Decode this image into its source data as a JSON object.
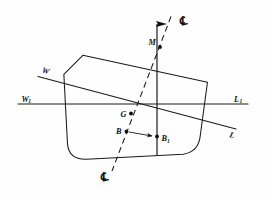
{
  "figure": {
    "background_color": "#fefefe",
    "ink_color": "#101010"
  },
  "labels": {
    "upright_waterline_port": "W",
    "upright_waterline_port_sub": "1",
    "upright_waterline_starboard": "L",
    "upright_waterline_starboard_sub": "1",
    "heeled_waterline_port": "W",
    "heeled_waterline_starboard": "L",
    "metacenter": "M",
    "center_of_gravity": "G",
    "center_of_buoyancy": "B",
    "shifted_center_of_buoyancy": "B",
    "shifted_center_of_buoyancy_sub": "1",
    "centerline_top": "℄",
    "centerline_bottom": "℄"
  },
  "points": [
    {
      "name": "M",
      "x": 160.0,
      "y": 47.0,
      "role": "metacenter"
    },
    {
      "name": "G",
      "x": 131.0,
      "y": 113.5,
      "role": "center-of-gravity"
    },
    {
      "name": "B",
      "x": 126.0,
      "y": 131.5,
      "role": "center-of-buoyancy"
    },
    {
      "name": "B1",
      "x": 157.0,
      "y": 136.5,
      "role": "shifted-center-of-buoyancy"
    }
  ],
  "geometry": {
    "upright_waterline": {
      "x1": 18.0,
      "y1": 104.0,
      "x2": 248.0,
      "y2": 104.0
    },
    "heeled_waterline": {
      "x1": 38.0,
      "y1": 77.0,
      "x2": 236.0,
      "y2": 129.0
    },
    "vertical_through_M": {
      "x1": 157.0,
      "y1": 13.0,
      "x2": 157.0,
      "y2": 155.0
    },
    "centerline_dashed": {
      "x1": 171.0,
      "y1": 16.0,
      "x2": 112.0,
      "y2": 172.0
    },
    "shift_arrow": {
      "x1": 128.0,
      "y1": 132.0,
      "x2": 154.0,
      "y2": 136.5
    },
    "hull_outline": "M 85 53 L 208 86 L 198 140 Q 196 155 181 157 L 83 157 Q 66 157 65 141 L 65 70 Z"
  }
}
